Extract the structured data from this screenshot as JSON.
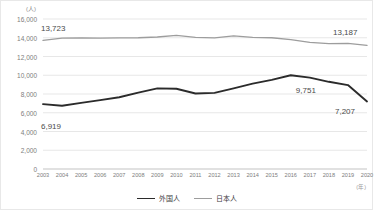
{
  "chart_data": {
    "type": "line",
    "title": "",
    "xlabel": "(年)",
    "ylabel": "(人)",
    "ylim": [
      0,
      16000
    ],
    "ytick_values": [
      16000,
      14000,
      12000,
      10000,
      8000,
      6000,
      4000,
      2000,
      0
    ],
    "ytick_labels": [
      "16,000",
      "14,000",
      "12,000",
      "10,000",
      "8,000",
      "6,000",
      "4,000",
      "2,000",
      "0"
    ],
    "grid": true,
    "legend_position": "bottom",
    "categories": [
      "2003",
      "2004",
      "2005",
      "2006",
      "2007",
      "2008",
      "2009",
      "2010",
      "2011",
      "2012",
      "2013",
      "2014",
      "2015",
      "2016",
      "2017",
      "2018",
      "2019",
      "2020"
    ],
    "series": [
      {
        "name": "外国人",
        "color": "#2b2b2b",
        "values": [
          6919,
          6750,
          7050,
          7350,
          7650,
          8150,
          8600,
          8560,
          8050,
          8120,
          8600,
          9100,
          9500,
          10000,
          9751,
          9300,
          8950,
          7207
        ]
      },
      {
        "name": "日本人",
        "color": "#9d9d9d",
        "values": [
          13723,
          13950,
          13990,
          13950,
          13980,
          14000,
          14080,
          14250,
          14050,
          13990,
          14200,
          14050,
          14000,
          13800,
          13500,
          13380,
          13400,
          13187
        ]
      }
    ],
    "annotations": [
      {
        "text": "13,723",
        "series": "日本人",
        "category": "2003",
        "value": 13723
      },
      {
        "text": "13,187",
        "series": "日本人",
        "category": "2020",
        "value": 13187
      },
      {
        "text": "9,751",
        "series": "外国人",
        "category": "2017",
        "value": 9751
      },
      {
        "text": "7,207",
        "series": "外国人",
        "category": "2020",
        "value": 7207
      },
      {
        "text": "6,919",
        "series": "外国人",
        "category": "2003",
        "value": 6919
      }
    ]
  },
  "legend": {
    "items": [
      {
        "label": "外国人"
      },
      {
        "label": "日本人"
      }
    ]
  }
}
